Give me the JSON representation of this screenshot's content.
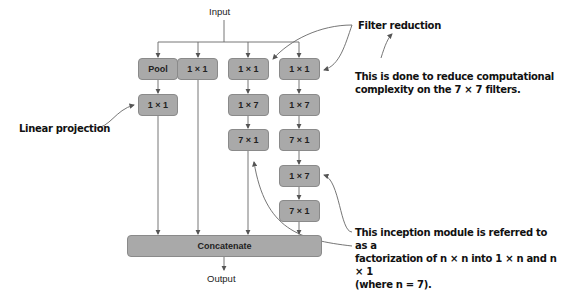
{
  "diagram": {
    "input_label": "Input",
    "output_label": "Output",
    "concat_label": "Concatenate",
    "columns": [
      {
        "boxes": [
          "Pool",
          "1 × 1"
        ]
      },
      {
        "boxes": [
          "1 × 1"
        ]
      },
      {
        "boxes": [
          "1 × 1",
          "1 × 7",
          "7 × 1"
        ]
      },
      {
        "boxes": [
          "1 × 1",
          "1 × 7",
          "7 × 1",
          "1 × 7",
          "7 × 1"
        ]
      }
    ],
    "colors": {
      "box_fill": "#a9a9a9",
      "box_border": "#8a8a8a",
      "line": "#555555"
    }
  },
  "annotations": {
    "filter_reduction": "Filter reduction",
    "filter_reduction_note_line1": "This is done to reduce computational",
    "filter_reduction_note_line2": "complexity on the 7 × 7 filters.",
    "linear_projection": "Linear projection",
    "factorization_line1": "This inception module is referred to as a",
    "factorization_line2": "factorization of n × n into 1 × n and n × 1",
    "factorization_line3": "(where n = 7)."
  }
}
